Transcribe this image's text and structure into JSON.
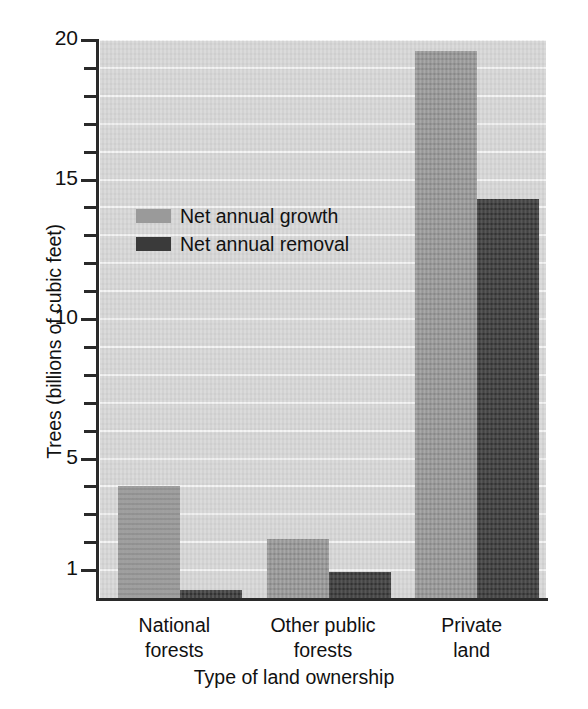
{
  "chart_data": {
    "type": "bar",
    "title": "",
    "xlabel": "Type of land ownership",
    "ylabel": "Trees (billions of cubic feet)",
    "categories": [
      "National forests",
      "Other public forests",
      "Private land"
    ],
    "category_lines": [
      [
        "National",
        "forests"
      ],
      [
        "Other public",
        "forests"
      ],
      [
        "Private",
        "land"
      ]
    ],
    "series": [
      {
        "name": "Net annual growth",
        "color": "#9a9a9a",
        "values": [
          4.0,
          2.1,
          19.6
        ]
      },
      {
        "name": "Net annual removal",
        "color": "#3a3a3a",
        "values": [
          0.3,
          0.95,
          14.3
        ]
      }
    ],
    "ylim": [
      0,
      20
    ],
    "y_tick_values": [
      1,
      2,
      3,
      4,
      5,
      6,
      7,
      8,
      9,
      10,
      11,
      12,
      13,
      14,
      15,
      16,
      17,
      18,
      19,
      20
    ],
    "y_tick_labels": [
      "1",
      "",
      "",
      "",
      "5",
      "",
      "",
      "",
      "",
      "10",
      "",
      "",
      "",
      "",
      "15",
      "",
      "",
      "",
      "",
      "20"
    ],
    "y_labeled_ticks": [
      {
        "value": 20,
        "label": "20"
      },
      {
        "value": 15,
        "label": "15"
      },
      {
        "value": 10,
        "label": "10"
      },
      {
        "value": 5,
        "label": "5"
      },
      {
        "value": 1,
        "label": "1"
      }
    ],
    "grid": true,
    "grid_axis": "y",
    "legend_position": "inside-upper-left",
    "plot_background": "#d9d9d9",
    "gridline_color": "#f4f4f4"
  },
  "legend": {
    "items": [
      {
        "label": "Net annual growth",
        "swatch": "growth"
      },
      {
        "label": "Net annual removal",
        "swatch": "removal"
      }
    ]
  }
}
